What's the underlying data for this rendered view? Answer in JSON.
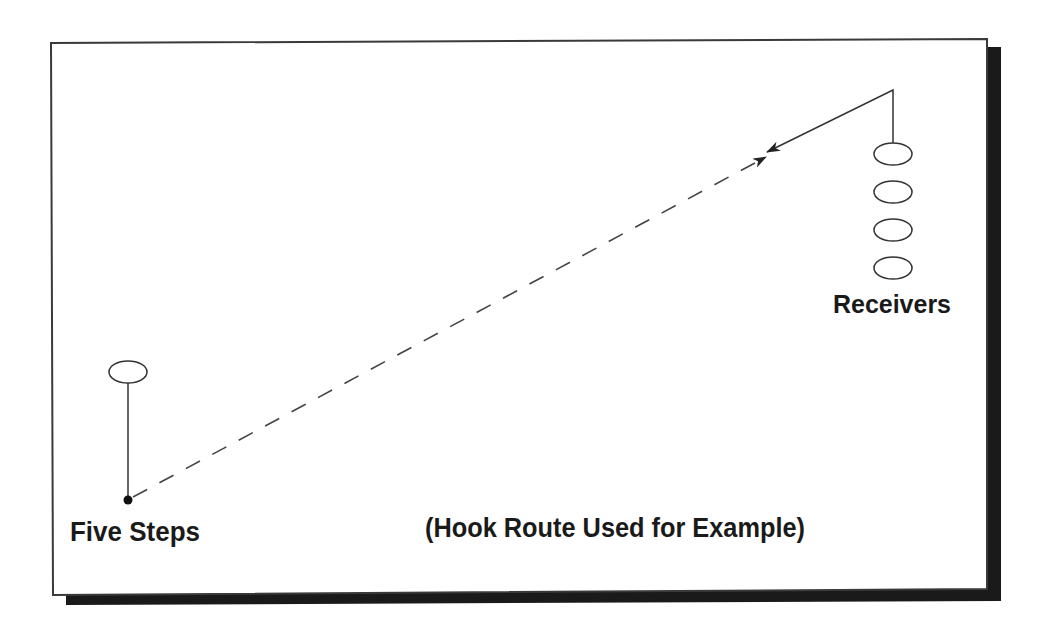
{
  "diagram": {
    "labels": {
      "quarterback_drop": "Five Steps",
      "receivers": "Receivers",
      "caption": "(Hook Route Used for Example)"
    },
    "colors": {
      "background": "#ffffff",
      "frame_border": "#3a3a3a",
      "shadow": "#1a1a1a",
      "lines": "#333333",
      "text": "#1a1a1a"
    },
    "quarterback": {
      "start": {
        "x": 128,
        "y": 372
      },
      "drop_point": {
        "x": 128,
        "y": 500
      },
      "drop_description": "Five Steps"
    },
    "receivers": {
      "count": 4,
      "x": 893,
      "y_positions": [
        154,
        192,
        230,
        268
      ]
    },
    "routes": {
      "receiver_route": {
        "type": "hook",
        "points": [
          [
            893,
            143
          ],
          [
            893,
            90
          ],
          [
            767,
            152
          ]
        ]
      },
      "pass_path": {
        "style": "dashed",
        "from": [
          128,
          500
        ],
        "to": [
          766,
          157
        ]
      }
    }
  }
}
